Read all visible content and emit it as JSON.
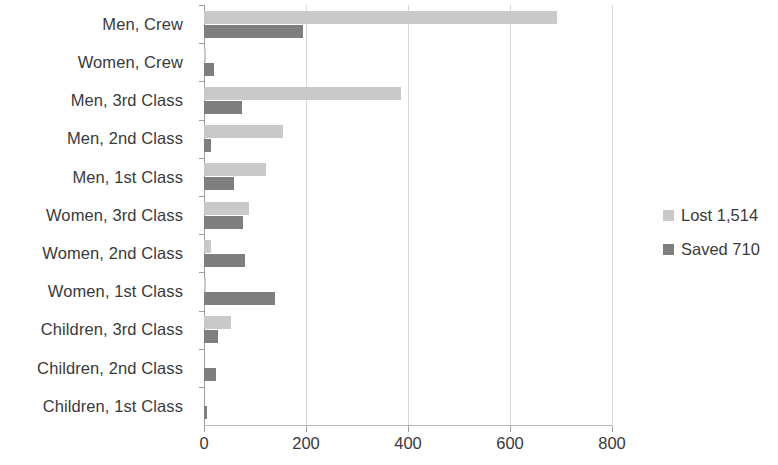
{
  "chart_data": {
    "type": "bar",
    "orientation": "horizontal",
    "title": "",
    "subtitle": "",
    "xlabel": "",
    "ylabel": "",
    "xlim": [
      0,
      800
    ],
    "xticks": [
      0,
      200,
      400,
      600,
      800
    ],
    "xtick_labels": [
      "0",
      "200",
      "400",
      "600",
      "800"
    ],
    "grid": "vertical",
    "legend_position": "right",
    "categories": [
      "Men, Crew",
      "Women, Crew",
      "Men, 3rd Class",
      "Men, 2nd Class",
      "Men, 1st Class",
      "Women, 3rd Class",
      "Women, 2nd Class",
      "Women, 1st Class",
      "Children, 3rd Class",
      "Children, 2nd Class",
      "Children, 1st Class"
    ],
    "series": [
      {
        "name": "Lost 1,514",
        "color": "#c9c9c9",
        "values": [
          693,
          3,
          387,
          154,
          122,
          89,
          13,
          4,
          52,
          0,
          0
        ]
      },
      {
        "name": "Saved 710",
        "color": "#7e7e7e",
        "values": [
          194,
          20,
          75,
          14,
          58,
          76,
          80,
          140,
          27,
          24,
          6
        ]
      }
    ]
  },
  "legend": {
    "items": [
      {
        "label": "Lost 1,514",
        "swatch": "lost"
      },
      {
        "label": "Saved 710",
        "swatch": "saved"
      }
    ]
  },
  "colors": {
    "lost": "#c9c9c9",
    "saved": "#7e7e7e",
    "axis": "#9e9e9e",
    "grid": "#d9d9d9",
    "text": "#3a3a3a",
    "background": "#ffffff"
  }
}
